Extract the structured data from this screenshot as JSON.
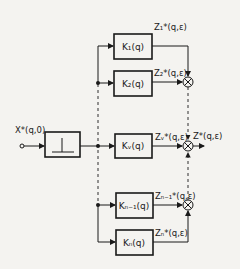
{
  "diagram": {
    "type": "block-diagram",
    "input": {
      "label": "X*(q,0)"
    },
    "sampler": {
      "label": "impulse-element"
    },
    "blocks": [
      {
        "id": "k1",
        "label": "K₁(q)",
        "output": "Z₁*(q,ε)"
      },
      {
        "id": "k2",
        "label": "K₂(q)",
        "output": "Z₂*(q,ε)"
      },
      {
        "id": "kv",
        "label": "Kᵥ(q)",
        "output": "Zᵥ*(q,ε)"
      },
      {
        "id": "kn1",
        "label": "Kₙ₋₁(q)",
        "output": "Zₙ₋₁*(q,ε)"
      },
      {
        "id": "kn",
        "label": "Kₙ(q)",
        "output": "Zₙ*(q,ε)"
      }
    ],
    "output": {
      "label": "Z*(q,ε)"
    }
  }
}
